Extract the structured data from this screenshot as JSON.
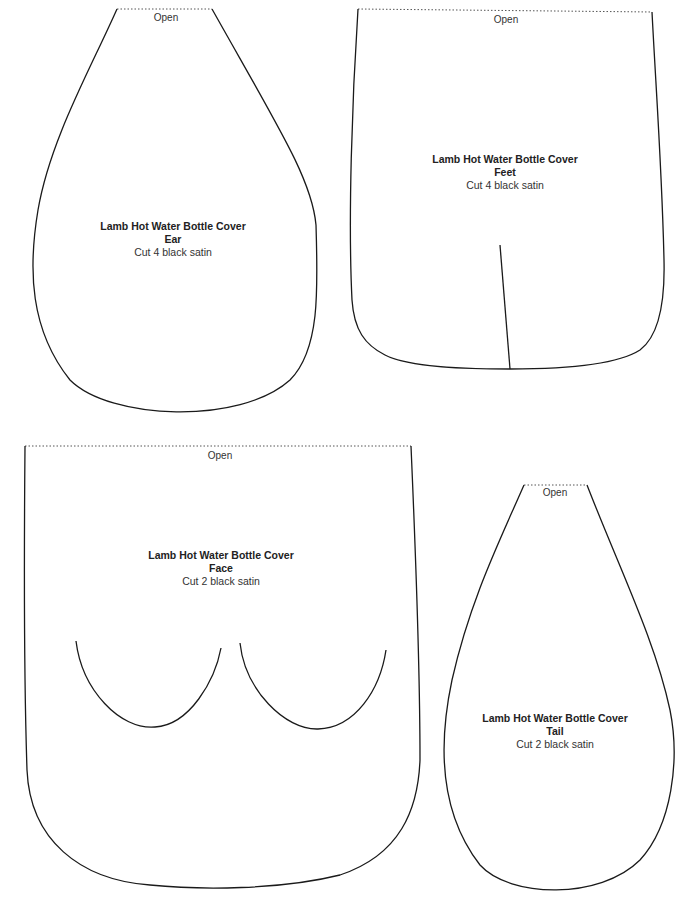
{
  "document": {
    "title": "Lamb Hot Water Bottle Cover pattern pieces",
    "stroke_color": "#1a1a1a",
    "background": "#ffffff"
  },
  "pieces": [
    {
      "id": "ear",
      "open_label": "Open",
      "title": "Lamb Hot Water Bottle Cover",
      "part": "Ear",
      "cut": "Cut 4 black satin"
    },
    {
      "id": "feet",
      "open_label": "Open",
      "title": "Lamb Hot Water Bottle Cover",
      "part": "Feet",
      "cut": "Cut 4 black satin"
    },
    {
      "id": "face",
      "open_label": "Open",
      "title": "Lamb Hot Water Bottle Cover",
      "part": "Face",
      "cut": "Cut 2 black satin"
    },
    {
      "id": "tail",
      "open_label": "Open",
      "title": "Lamb Hot Water Bottle Cover",
      "part": "Tail",
      "cut": "Cut 2 black satin"
    }
  ]
}
